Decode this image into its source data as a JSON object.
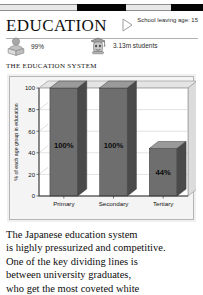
{
  "top_strip": {
    "segments": [
      "light",
      "dark",
      "light",
      "dark"
    ]
  },
  "header": {
    "title": "EDUCATION",
    "school_leaving": "School leaving age: 15",
    "marker_icon": "triangle-right-icon"
  },
  "stats": [
    {
      "icon": "person-reading-book-icon",
      "value": "99%"
    },
    {
      "icon": "graduate-mortarboard-icon",
      "value": "3.13m students"
    }
  ],
  "chart_data": {
    "type": "bar",
    "title": "THE EDUCATION SYSTEM",
    "categories": [
      "Primary",
      "Secondary",
      "Tertiary"
    ],
    "values": [
      100,
      100,
      44
    ],
    "data_labels": [
      "100%",
      "100%",
      "44%"
    ],
    "xlabel": "",
    "ylabel": "% of each age group in education",
    "ylim": [
      0,
      100
    ],
    "yticks": [
      0,
      20,
      40,
      60,
      80,
      100
    ],
    "ytick_labels": [
      "0",
      "20",
      "40",
      "60",
      "80",
      "100"
    ],
    "grid": true,
    "legend": null,
    "style": "3d-bars",
    "colors": {
      "bar_front": "#6e6e6e",
      "bar_side": "#4a4a4a",
      "bar_top": "#9a9a9a",
      "panel": "#f0f0f0",
      "plot_bg": "#ffffff",
      "grid": "#c9c9c9",
      "axis": "#3a3a3a",
      "label": "#111111"
    }
  },
  "body": {
    "lines": [
      "The Japanese education system",
      "is highly pressurized and competitive.",
      "One of the key dividing lines is",
      "between university graduates,",
      "who get the most coveted white"
    ]
  }
}
